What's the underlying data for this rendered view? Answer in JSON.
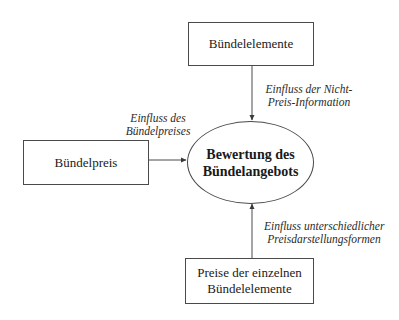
{
  "diagram": {
    "title": "",
    "nodes": {
      "top": {
        "id": "buendelelemente",
        "lines": [
          "Bündelelemente"
        ]
      },
      "left": {
        "id": "buendelpreis",
        "lines": [
          "Bündelpreis"
        ]
      },
      "center": {
        "id": "bewertung",
        "lines": [
          "Bewertung des",
          "Bündelangebots"
        ]
      },
      "bottom": {
        "id": "preise-einzeln",
        "lines": [
          "Preise der einzelnen",
          "Bündelelemente"
        ]
      }
    },
    "edges": {
      "top_to_center": {
        "from": "buendelelemente",
        "to": "bewertung",
        "label_lines": [
          "Einfluss der Nicht-",
          "Preis-Information"
        ]
      },
      "left_to_center": {
        "from": "buendelpreis",
        "to": "bewertung",
        "label_lines": [
          "Einfluss des",
          "Bündelpreises"
        ]
      },
      "bottom_to_center": {
        "from": "preise-einzeln",
        "to": "bewertung",
        "label_lines": [
          "Einfluss unterschiedlicher",
          "Preisdarstellungsformen"
        ]
      }
    },
    "colors": {
      "line": "#4a4a4a",
      "background": "#ffffff",
      "text": "#1a1a1a"
    }
  }
}
